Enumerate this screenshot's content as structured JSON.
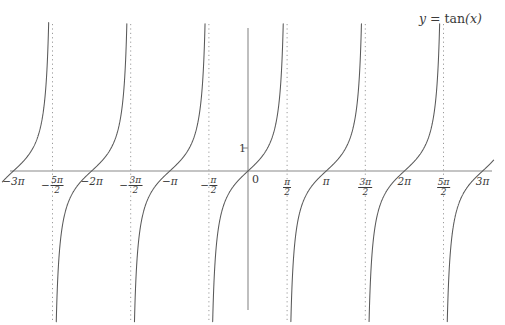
{
  "chart_data": {
    "type": "line",
    "title": "y = tan(x)",
    "function": "tan(x)",
    "xlabel": "",
    "ylabel": "",
    "xlim": [
      -9.8696,
      9.8696
    ],
    "ylim": [
      -6.2174,
      6.2174
    ],
    "grid": false,
    "legend": false,
    "x_tick_values": [
      -9.4248,
      -7.854,
      -6.2832,
      -4.7124,
      -3.1416,
      -1.5708,
      0,
      1.5708,
      3.1416,
      4.7124,
      6.2832,
      7.854,
      9.4248
    ],
    "x_tick_labels": [
      {
        "sign": "-",
        "whole": "3π",
        "num": "",
        "den": ""
      },
      {
        "sign": "-",
        "whole": "",
        "num": "5π",
        "den": "2"
      },
      {
        "sign": "-",
        "whole": "2π",
        "num": "",
        "den": ""
      },
      {
        "sign": "-",
        "whole": "",
        "num": "3π",
        "den": "2"
      },
      {
        "sign": "-",
        "whole": "π",
        "num": "",
        "den": ""
      },
      {
        "sign": "-",
        "whole": "",
        "num": "π",
        "den": "2"
      },
      {
        "sign": "",
        "whole": "0",
        "num": "",
        "den": ""
      },
      {
        "sign": "",
        "whole": "",
        "num": "π",
        "den": "2"
      },
      {
        "sign": "",
        "whole": "π",
        "num": "",
        "den": ""
      },
      {
        "sign": "",
        "whole": "",
        "num": "3π",
        "den": "2"
      },
      {
        "sign": "",
        "whole": "2π",
        "num": "",
        "den": ""
      },
      {
        "sign": "",
        "whole": "",
        "num": "5π",
        "den": "2"
      },
      {
        "sign": "",
        "whole": "3π",
        "num": "",
        "den": ""
      }
    ],
    "y_tick_values": [
      1
    ],
    "y_tick_labels": [
      "1"
    ],
    "zero_label": "0",
    "asymptotes": [
      -7.854,
      -4.7124,
      -1.5708,
      1.5708,
      4.7124,
      7.854
    ],
    "asymptote_style": "dotted",
    "zero_crossings": [
      -9.4248,
      -6.2832,
      -3.1416,
      0,
      3.1416,
      6.2832,
      9.4248
    ],
    "branches": [
      {
        "x_start": -9.8696,
        "x_end": -7.854
      },
      {
        "x_start": -7.854,
        "x_end": -4.7124
      },
      {
        "x_start": -4.7124,
        "x_end": -1.5708
      },
      {
        "x_start": -1.5708,
        "x_end": 1.5708
      },
      {
        "x_start": 1.5708,
        "x_end": 4.7124
      },
      {
        "x_start": 4.7124,
        "x_end": 7.854
      },
      {
        "x_start": 7.854,
        "x_end": 9.8696
      }
    ],
    "colors": {
      "curve": "#595959",
      "axis": "#8a8a8a",
      "asymptote": "#9a9a9a",
      "text": "#3a3a3a",
      "background": "#ffffff"
    }
  },
  "title": {
    "lhs": "y",
    "equals": "=",
    "func": "tan",
    "arg": "(x)",
    "full": "y = tan(x)"
  },
  "axes": {
    "x_axis_name": "x-axis",
    "y_axis_name": "y-axis",
    "origin_label": "0",
    "y_one_label": "1"
  }
}
